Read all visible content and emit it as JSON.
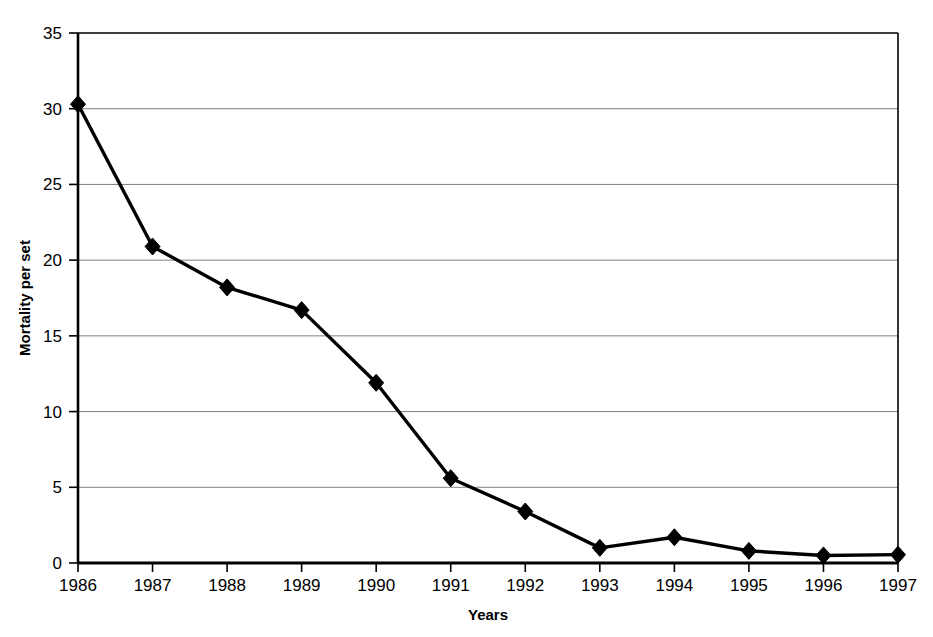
{
  "chart_data": {
    "type": "line",
    "title": "",
    "xlabel": "Years",
    "ylabel": "Mortality per set",
    "categories": [
      "1986",
      "1987",
      "1988",
      "1989",
      "1990",
      "1991",
      "1992",
      "1993",
      "1994",
      "1995",
      "1996",
      "1997"
    ],
    "x": [
      1986,
      1987,
      1988,
      1989,
      1990,
      1991,
      1992,
      1993,
      1994,
      1995,
      1996,
      1997
    ],
    "values": [
      30.3,
      20.9,
      18.2,
      16.7,
      11.9,
      5.6,
      3.4,
      1.0,
      1.7,
      0.8,
      0.5,
      0.55
    ],
    "series": [
      {
        "name": "Mortality per set",
        "values": [
          30.3,
          20.9,
          18.2,
          16.7,
          11.9,
          5.6,
          3.4,
          1.0,
          1.7,
          0.8,
          0.5,
          0.55
        ]
      }
    ],
    "ylim": [
      0,
      35
    ],
    "yticks": [
      0,
      5,
      10,
      15,
      20,
      25,
      30,
      35
    ],
    "ytick_labels": [
      "0",
      "5",
      "10",
      "15",
      "20",
      "25",
      "30",
      "35"
    ],
    "xtick_labels": [
      "1986",
      "1987",
      "1988",
      "1989",
      "1990",
      "1991",
      "1992",
      "1993",
      "1994",
      "1995",
      "1996",
      "1997"
    ],
    "grid": "horizontal",
    "legend": "none",
    "marker": "diamond",
    "line_color": "#000000",
    "marker_color": "#000000",
    "grid_color": "#808080",
    "axis_color": "#000000",
    "background_color": "#ffffff"
  },
  "axes": {
    "y_title": "Mortality per set",
    "x_title": "Years"
  }
}
